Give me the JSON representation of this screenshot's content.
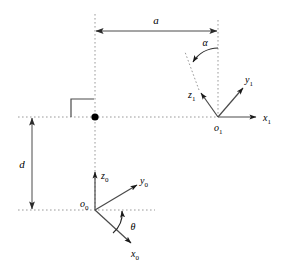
{
  "figure": {
    "background_color": "#ffffff",
    "stroke_color": "#3a3a3a",
    "text_color": "#000000",
    "dotted_color": "#8c8c8c"
  },
  "dimensions": {
    "a": {
      "label": "a",
      "orientation": "horizontal",
      "style": "double-arrow"
    },
    "d": {
      "label": "d",
      "orientation": "vertical",
      "style": "double-arrow"
    }
  },
  "angles": {
    "alpha": {
      "label": "α",
      "arc": "from vertical dotted axis to z1 axis extension"
    },
    "theta": {
      "label": "θ",
      "arc": "from x0 axis to horizontal dotted axis"
    }
  },
  "frame0": {
    "origin_label": "o",
    "origin_sub": "0",
    "axes": [
      {
        "name": "z",
        "sub": "0",
        "label": "z",
        "direction": "up"
      },
      {
        "name": "y",
        "sub": "0",
        "label": "y",
        "direction": "upper-right"
      },
      {
        "name": "x",
        "sub": "0",
        "label": "x",
        "direction": "lower-right"
      }
    ]
  },
  "frame1": {
    "origin_label": "o",
    "origin_sub": "1",
    "axes": [
      {
        "name": "x",
        "sub": "1",
        "label": "x",
        "direction": "right"
      },
      {
        "name": "y",
        "sub": "1",
        "label": "y",
        "direction": "upper-right"
      },
      {
        "name": "z",
        "sub": "1",
        "label": "z",
        "direction": "upper-left"
      }
    ]
  },
  "markers": {
    "joint_dot": "filled-black-dot",
    "right_angle": "perpendicular-square-marker"
  }
}
